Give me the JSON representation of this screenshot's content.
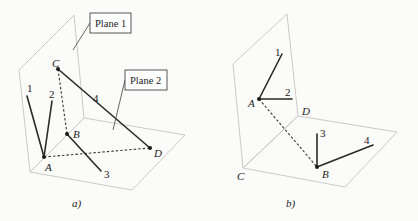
{
  "panel_a": {
    "caption": "a)",
    "callouts": {
      "plane1": "Plane 1",
      "plane2": "Plane 2"
    },
    "points": {
      "A": "A",
      "B": "B",
      "C": "C",
      "D": "D"
    },
    "lines": {
      "l1": "1",
      "l2": "2",
      "l3": "3",
      "l4": "4"
    }
  },
  "panel_b": {
    "caption": "b)",
    "points": {
      "A": "A",
      "B": "B",
      "C": "C",
      "D": "D"
    },
    "lines": {
      "l1": "1",
      "l2": "2",
      "l3": "3",
      "l4": "4"
    }
  }
}
